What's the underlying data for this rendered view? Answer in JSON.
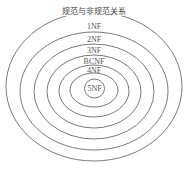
{
  "diagram": {
    "title": "规范与非规范关系",
    "type": "nested-ellipses",
    "rings": [
      {
        "label": "规范与非规范关系",
        "cx": 94,
        "cy": 86,
        "rx": 88,
        "ry": 75
      },
      {
        "label": "1NF",
        "cx": 94,
        "cy": 91,
        "rx": 74,
        "ry": 59
      },
      {
        "label": "2NF",
        "cx": 94,
        "cy": 91.5,
        "rx": 60,
        "ry": 47.5
      },
      {
        "label": "3NF",
        "cx": 94,
        "cy": 91.5,
        "rx": 47,
        "ry": 36.5
      },
      {
        "label": "BCNF",
        "cx": 94,
        "cy": 91,
        "rx": 35,
        "ry": 26
      },
      {
        "label": "4NF",
        "cx": 94,
        "cy": 90,
        "rx": 24,
        "ry": 17
      },
      {
        "label": "5NF",
        "cx": 94.5,
        "cy": 88.5,
        "rx": 10,
        "ry": 9.5
      }
    ],
    "labels": {
      "outer": "规范与非规范关系",
      "nf1": "1NF",
      "nf2": "2NF",
      "nf3": "3NF",
      "bcnf": "BCNF",
      "nf4": "4NF",
      "nf5": "5NF"
    },
    "colors": {
      "stroke": "#6a6a6a",
      "text": "#555555",
      "background": "#ffffff"
    }
  }
}
